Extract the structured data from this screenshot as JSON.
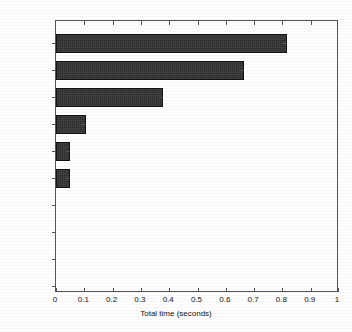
{
  "chart_data": {
    "type": "bar",
    "orientation": "horizontal",
    "title": "",
    "xlabel": "Total time (seconds)",
    "ylabel": "",
    "categories": [
      "membrane",
      "besselj",
      "besselmx",
      "besschk",
      "log10",
      "meshgrid",
      "profile",
      "rot90",
      "realmax",
      "realmin"
    ],
    "values": [
      0.82,
      0.665,
      0.38,
      0.105,
      0.05,
      0.05,
      0,
      0,
      0,
      0
    ],
    "xlim": [
      0,
      1
    ],
    "xticks": [
      0,
      0.1,
      0.2,
      0.3,
      0.4,
      0.5,
      0.6,
      0.7,
      0.8,
      0.9,
      1
    ],
    "xticklabels": [
      "0",
      "0.1",
      "0.2",
      "0.3",
      "0.4",
      "0.5",
      "0.6",
      "0.7",
      "0.8",
      "0.9",
      "1"
    ],
    "grid": false,
    "legend": null,
    "bar_color": "#2e2e2e",
    "bar_edge_color": "#111111",
    "axis_color": "#555555",
    "background": "#ffffff"
  }
}
